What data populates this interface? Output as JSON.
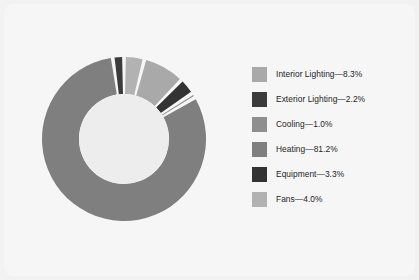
{
  "chart_data": {
    "type": "pie",
    "variant": "donut",
    "title": "",
    "subtitle": "",
    "xlabel": "",
    "ylabel": "",
    "grid": false,
    "legend_position": "right",
    "value_unit": "%",
    "start_angle_deg": 0,
    "direction": "clockwise",
    "inner_radius_ratio": 0.55,
    "categories": [
      "Interior Lighting",
      "Exterior Lighting",
      "Cooling",
      "Heating",
      "Equipment",
      "Fans"
    ],
    "values": [
      8.3,
      2.2,
      1.0,
      81.2,
      3.3,
      4.0
    ],
    "colors": [
      "#a9a9a9",
      "#3b3b3b",
      "#8e8e8e",
      "#7f7f7f",
      "#333333",
      "#b2b2b2"
    ],
    "slices": [
      {
        "label": "Interior Lighting",
        "value": 8.3,
        "color": "#a9a9a9",
        "legend_text": "Interior Lighting—8.3%"
      },
      {
        "label": "Exterior Lighting",
        "value": 2.2,
        "color": "#3b3b3b",
        "legend_text": "Exterior Lighting—2.2%"
      },
      {
        "label": "Cooling",
        "value": 1.0,
        "color": "#8e8e8e",
        "legend_text": "Cooling—1.0%"
      },
      {
        "label": "Heating",
        "value": 81.2,
        "color": "#7f7f7f",
        "legend_text": "Heating—81.2%"
      },
      {
        "label": "Equipment",
        "value": 3.3,
        "color": "#333333",
        "legend_text": "Equipment—3.3%"
      },
      {
        "label": "Fans",
        "value": 4.0,
        "color": "#b2b2b2",
        "legend_text": "Fans—4.0%"
      }
    ],
    "draw_order_clockwise_from_top": [
      "Fans",
      "Interior Lighting",
      "Equipment",
      "Cooling",
      "Heating",
      "Exterior Lighting"
    ]
  },
  "legend": {
    "items": [
      {
        "label": "Interior Lighting—8.3%",
        "color": "#a9a9a9"
      },
      {
        "label": "Exterior Lighting—2.2%",
        "color": "#3b3b3b"
      },
      {
        "label": "Cooling—1.0%",
        "color": "#8e8e8e"
      },
      {
        "label": "Heating—81.2%",
        "color": "#7f7f7f"
      },
      {
        "label": "Equipment—3.3%",
        "color": "#333333"
      },
      {
        "label": "Fans—4.0%",
        "color": "#b2b2b2"
      }
    ]
  },
  "style": {
    "page_background": "#f2f2f2",
    "card_background": "#f6f6f6",
    "slice_gap_color": "#f6f6f6",
    "hole_color": "#ededed",
    "text_color": "#1d1d1d"
  }
}
